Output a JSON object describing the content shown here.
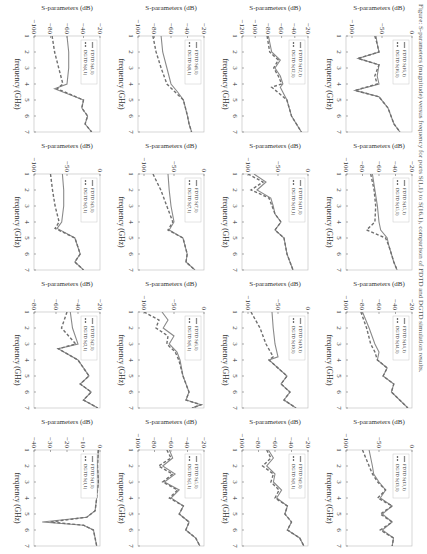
{
  "chart_data": [
    {
      "type": "line",
      "id": "S(1,1)",
      "legend": [
        "FDTD S(1,1)",
        "DGTD S(1,1)"
      ],
      "xlabel": "frequency (GHz)",
      "ylabel": "S-parameters (dB)",
      "xticks": [
        1,
        2,
        3,
        4,
        5,
        6,
        7
      ],
      "yticks": [
        0,
        -10,
        -20,
        -30,
        -40
      ],
      "ylim": [
        -40,
        0
      ],
      "x": [
        1,
        2,
        3,
        4,
        4.8,
        5.2,
        5.5,
        5.7,
        6,
        6.5,
        7
      ],
      "series": [
        {
          "name": "FDTD S(1,1)",
          "values": [
            -1,
            -1.5,
            -1,
            -2,
            -3,
            -8,
            -35,
            -10,
            -4,
            -3,
            -2
          ]
        },
        {
          "name": "DGTD S(1,1)",
          "values": [
            -1,
            -1.5,
            -1,
            -2,
            -3,
            -8,
            -30,
            -10,
            -4,
            -3,
            -2
          ]
        }
      ]
    },
    {
      "type": "line",
      "id": "S(2,1)",
      "legend": [
        "FDTD S(2,1)",
        "DGTD S(2,1)"
      ],
      "xlabel": "frequency (GHz)",
      "ylabel": "S-parameters (dB)",
      "xticks": [
        1,
        2,
        3,
        4,
        5,
        6,
        7
      ],
      "yticks": [
        -20,
        -40,
        -60,
        -80
      ],
      "ylim": [
        -80,
        -20
      ],
      "x": [
        1,
        2,
        3,
        3.3,
        4,
        5,
        5.5,
        6,
        6.5,
        7
      ],
      "series": [
        {
          "name": "FDTD S(2,1)",
          "values": [
            -47,
            -45,
            -40,
            -58,
            -40,
            -30,
            -38,
            -28,
            -35,
            -22
          ]
        },
        {
          "name": "DGTD S(2,1)",
          "values": [
            -50,
            -55,
            -42,
            -58,
            -40,
            -30,
            -38,
            -28,
            -35,
            -22
          ]
        }
      ]
    },
    {
      "type": "line",
      "id": "S(3,1)",
      "legend": [
        "FDTD S(3,1)",
        "DGTD S(3,1)"
      ],
      "xlabel": "frequency (GHz)",
      "ylabel": "S-parameters (dB)",
      "xticks": [
        1,
        2,
        3,
        4,
        5,
        6,
        7
      ],
      "yticks": [
        0,
        -50,
        -100
      ],
      "ylim": [
        -100,
        0
      ],
      "x": [
        1,
        2,
        3,
        4,
        4.4,
        5,
        6,
        6.5,
        7
      ],
      "series": [
        {
          "name": "FDTD S(3,1)",
          "values": [
            -57,
            -55,
            -55,
            -58,
            -65,
            -38,
            -30,
            -38,
            -25
          ]
        },
        {
          "name": "DGTD S(3,1)",
          "values": [
            -75,
            -72,
            -68,
            -62,
            -68,
            -38,
            -30,
            -38,
            -25
          ]
        }
      ]
    },
    {
      "type": "line",
      "id": "S(4,1)",
      "legend": [
        "FDTD S(4,1)",
        "DGTD S(4,1)"
      ],
      "xlabel": "frequency (GHz)",
      "ylabel": "S-parameters (dB)",
      "xticks": [
        1,
        2,
        3,
        4,
        5,
        6,
        7
      ],
      "yticks": [
        -20,
        -40,
        -60,
        -80,
        -100
      ],
      "ylim": [
        -100,
        -20
      ],
      "x": [
        1,
        2,
        3,
        4,
        4.3,
        5,
        5.5,
        6,
        6.5,
        7
      ],
      "series": [
        {
          "name": "FDTD S(4,1)",
          "values": [
            -60,
            -58,
            -58,
            -60,
            -75,
            -40,
            -42,
            -35,
            -38,
            -30
          ]
        },
        {
          "name": "DGTD S(4,1)",
          "values": [
            -78,
            -75,
            -70,
            -65,
            -72,
            -40,
            -42,
            -35,
            -38,
            -30
          ]
        }
      ]
    },
    {
      "type": "line",
      "id": "S(5,1)",
      "legend": [
        "FDTD S(5,1)",
        "DGTD S(5,1)"
      ],
      "xlabel": "frequency (GHz)",
      "ylabel": "S-parameters (dB)",
      "xticks": [
        1,
        2,
        3,
        4,
        5,
        6,
        7
      ],
      "yticks": [
        -20,
        -40,
        -60,
        -80,
        -100
      ],
      "ylim": [
        -100,
        -20
      ],
      "x": [
        1,
        1.5,
        2,
        2.5,
        3,
        3.5,
        4,
        4.5,
        5,
        5.5,
        6,
        6.5,
        7
      ],
      "series": [
        {
          "name": "FDTD S(5,1)",
          "values": [
            -62,
            -58,
            -70,
            -55,
            -68,
            -50,
            -60,
            -45,
            -50,
            -38,
            -42,
            -30,
            -25
          ]
        },
        {
          "name": "DGTD S(5,1)",
          "values": [
            -65,
            -60,
            -75,
            -58,
            -70,
            -52,
            -62,
            -45,
            -50,
            -38,
            -42,
            -30,
            -25
          ]
        }
      ]
    },
    {
      "type": "line",
      "id": "S(6,1)",
      "legend": [
        "FDTD S(6,1)",
        "DGTD S(6,1)"
      ],
      "xlabel": "frequency (GHz)",
      "ylabel": "S-parameters (dB)",
      "xticks": [
        1,
        2,
        3,
        4,
        5,
        6,
        7
      ],
      "yticks": [
        0,
        -50,
        -100
      ],
      "ylim": [
        -110,
        0
      ],
      "x": [
        1,
        1.5,
        2,
        2.5,
        3,
        3.5,
        4,
        5,
        6,
        6.5,
        6.8,
        7
      ],
      "series": [
        {
          "name": "FDTD S(6,1)",
          "values": [
            -70,
            -60,
            -68,
            -50,
            -58,
            -45,
            -40,
            -35,
            -25,
            -30,
            -5,
            -20
          ]
        },
        {
          "name": "DGTD S(6,1)",
          "values": [
            -100,
            -75,
            -80,
            -60,
            -62,
            -48,
            -42,
            -35,
            -25,
            -30,
            -5,
            -20
          ]
        }
      ]
    },
    {
      "type": "line",
      "id": "S(7,1)",
      "legend": [
        "FDTD S(7,1)",
        "DGTD S(7,1)"
      ],
      "xlabel": "frequency (GHz)",
      "ylabel": "S-parameters (dB)",
      "xticks": [
        1,
        2,
        3,
        4,
        5,
        6,
        7
      ],
      "yticks": [
        0,
        -50,
        -100
      ],
      "ylim": [
        -110,
        0
      ],
      "x": [
        1,
        2,
        3,
        4,
        4.5,
        5,
        6,
        6.5,
        7
      ],
      "series": [
        {
          "name": "FDTD S(7,1)",
          "values": [
            -60,
            -58,
            -55,
            -50,
            -58,
            -35,
            -28,
            -30,
            -15
          ]
        },
        {
          "name": "DGTD S(7,1)",
          "values": [
            -85,
            -72,
            -62,
            -52,
            -60,
            -35,
            -28,
            -30,
            -15
          ]
        }
      ]
    },
    {
      "type": "line",
      "id": "S(8,1)",
      "legend": [
        "FDTD S(8,1)",
        "DGTD S(8,1)"
      ],
      "xlabel": "frequency (GHz)",
      "ylabel": "S-parameters (dB)",
      "xticks": [
        1,
        2,
        3,
        4,
        5,
        6,
        7
      ],
      "yticks": [
        -20,
        -40,
        -60,
        -80,
        -100
      ],
      "ylim": [
        -100,
        -20
      ],
      "x": [
        1,
        2,
        3,
        4,
        4.5,
        5,
        6,
        6.5,
        7
      ],
      "series": [
        {
          "name": "FDTD S(8,1)",
          "values": [
            -72,
            -70,
            -65,
            -60,
            -52,
            -45,
            -40,
            -38,
            -35
          ]
        },
        {
          "name": "DGTD S(8,1)",
          "values": [
            -82,
            -78,
            -72,
            -65,
            -55,
            -45,
            -40,
            -38,
            -35
          ]
        }
      ]
    },
    {
      "type": "line",
      "id": "S(9,1)",
      "legend": [
        "FDTD S(9,1)",
        "DGTD S(9,1)"
      ],
      "xlabel": "frequency (GHz)",
      "ylabel": "S-parameters (dB)",
      "xticks": [
        1,
        2,
        3,
        4,
        5,
        6,
        7
      ],
      "yticks": [
        -20,
        -40,
        -60,
        -80,
        -100
      ],
      "ylim": [
        -100,
        -20
      ],
      "x": [
        1,
        1.5,
        2,
        2.5,
        3,
        3.5,
        4,
        4.5,
        5,
        5.5,
        6,
        6.5,
        7
      ],
      "series": [
        {
          "name": "FDTD S(9,1)",
          "values": [
            -68,
            -62,
            -70,
            -60,
            -62,
            -52,
            -58,
            -45,
            -48,
            -40,
            -45,
            -30,
            -25
          ]
        },
        {
          "name": "DGTD S(9,1)",
          "values": [
            -70,
            -65,
            -75,
            -62,
            -65,
            -55,
            -60,
            -45,
            -48,
            -40,
            -45,
            -30,
            -25
          ]
        }
      ]
    },
    {
      "type": "line",
      "id": "S(10,1)",
      "legend": [
        "FDTD S(10,1)",
        "DGTD S(10,1)"
      ],
      "xlabel": "frequency (GHz)",
      "ylabel": "S-parameters (dB)",
      "xticks": [
        1,
        2,
        3,
        4,
        5,
        6,
        7
      ],
      "yticks": [
        0,
        -50,
        -100
      ],
      "ylim": [
        -110,
        0
      ],
      "x": [
        1,
        2,
        3,
        3.8,
        4,
        5,
        5.5,
        6,
        6.5,
        7
      ],
      "series": [
        {
          "name": "FDTD S(10,1)",
          "values": [
            -60,
            -58,
            -55,
            -50,
            -65,
            -35,
            -45,
            -30,
            -40,
            -20
          ]
        },
        {
          "name": "DGTD S(10,1)",
          "values": [
            -95,
            -80,
            -70,
            -58,
            -65,
            -35,
            -45,
            -30,
            -40,
            -20
          ]
        }
      ]
    },
    {
      "type": "line",
      "id": "S(11,1)",
      "legend": [
        "FDTD S(11,1)",
        "DGTD S(11,1)"
      ],
      "xlabel": "frequency (GHz)",
      "ylabel": "S-parameters (dB)",
      "xticks": [
        1,
        2,
        3,
        4,
        5,
        6,
        7
      ],
      "yticks": [
        0,
        -50,
        -100
      ],
      "ylim": [
        -110,
        0
      ],
      "x": [
        1,
        1.5,
        2,
        2.5,
        3,
        3.5,
        4,
        4.5,
        5,
        6,
        7
      ],
      "series": [
        {
          "name": "FDTD S(11,1)",
          "values": [
            -90,
            -70,
            -85,
            -62,
            -58,
            -55,
            -45,
            -55,
            -40,
            -35,
            -25
          ]
        },
        {
          "name": "DGTD S(11,1)",
          "values": [
            -100,
            -75,
            -95,
            -65,
            -60,
            -55,
            -45,
            -55,
            -40,
            -35,
            -25
          ]
        }
      ]
    },
    {
      "type": "line",
      "id": "S(12,1)",
      "legend": [
        "FDTD S(12,1)",
        "DGTD S(12,1)"
      ],
      "xlabel": "frequency (GHz)",
      "ylabel": "S-parameters (dB)",
      "xticks": [
        1,
        2,
        3,
        4,
        5,
        6,
        7
      ],
      "yticks": [
        -20,
        -40,
        -60,
        -80,
        -100,
        -120
      ],
      "ylim": [
        -120,
        -20
      ],
      "x": [
        1,
        2,
        2.5,
        3,
        3.5,
        4,
        4.2,
        5,
        6,
        7
      ],
      "series": [
        {
          "name": "FDTD S(12,1)",
          "values": [
            -80,
            -75,
            -62,
            -70,
            -62,
            -58,
            -62,
            -52,
            -45,
            -30
          ]
        },
        {
          "name": "DGTD S(12,1)",
          "values": [
            -82,
            -78,
            -65,
            -72,
            -65,
            -60,
            -75,
            -52,
            -45,
            -30
          ]
        }
      ]
    },
    {
      "type": "line",
      "id": "S(13,1)",
      "legend": [
        "FDTD S(13,1)",
        "DGTD S(13,1)"
      ],
      "xlabel": "frequency (GHz)",
      "ylabel": "S-parameters (dB)",
      "xticks": [
        1,
        2,
        3,
        4,
        5,
        6,
        7
      ],
      "yticks": [
        0,
        -50,
        -100
      ],
      "ylim": [
        -100,
        0
      ],
      "x": [
        1,
        2,
        2.5,
        3,
        3.5,
        4,
        4.5,
        5,
        5.5,
        6,
        6.5,
        7
      ],
      "series": [
        {
          "name": "FDTD S(13,1)",
          "values": [
            -65,
            -60,
            -58,
            -50,
            -40,
            -48,
            -30,
            -45,
            -30,
            -45,
            -28,
            -30
          ]
        },
        {
          "name": "DGTD S(13,1)",
          "values": [
            -75,
            -65,
            -60,
            -52,
            -40,
            -52,
            -30,
            -48,
            -30,
            -48,
            -28,
            -30
          ]
        }
      ]
    },
    {
      "type": "line",
      "id": "S(14,1)",
      "legend": [
        "FDTD S(14,1)",
        "DGTD S(14,1)"
      ],
      "xlabel": "frequency (GHz)",
      "ylabel": "S-parameters (dB)",
      "xticks": [
        1,
        2,
        3,
        4,
        5,
        6,
        7
      ],
      "yticks": [
        -20,
        -40,
        -60,
        -80,
        -100
      ],
      "ylim": [
        -100,
        -20
      ],
      "x": [
        1,
        2,
        3,
        3.5,
        4,
        4.5,
        5,
        5.5,
        6,
        7
      ],
      "series": [
        {
          "name": "FDTD S(14,1)",
          "values": [
            -80,
            -72,
            -65,
            -60,
            -62,
            -50,
            -55,
            -42,
            -45,
            -25
          ]
        },
        {
          "name": "DGTD S(14,1)",
          "values": [
            -82,
            -75,
            -70,
            -65,
            -62,
            -50,
            -55,
            -42,
            -45,
            -25
          ]
        }
      ]
    },
    {
      "type": "line",
      "id": "S(15,1)",
      "legend": [
        "FDTD S(15,1)",
        "DGTD S(15,1)"
      ],
      "xlabel": "frequency (GHz)",
      "ylabel": "S-parameters (dB)",
      "xticks": [
        1,
        2,
        3,
        4,
        5,
        6,
        7
      ],
      "yticks": [
        -20,
        -40,
        -60,
        -80,
        -100
      ],
      "ylim": [
        -100,
        -20
      ],
      "x": [
        1,
        2,
        3,
        4,
        4.5,
        5,
        5.5,
        6,
        6.5,
        7
      ],
      "series": [
        {
          "name": "FDTD S(15,1)",
          "values": [
            -68,
            -65,
            -62,
            -60,
            -58,
            -50,
            -48,
            -45,
            -42,
            -38
          ]
        },
        {
          "name": "DGTD S(15,1)",
          "values": [
            -70,
            -66,
            -64,
            -65,
            -75,
            -52,
            -48,
            -45,
            -42,
            -38
          ]
        }
      ]
    },
    {
      "type": "line",
      "id": "S(16,1)",
      "legend": [
        "FDTD S(16,1)",
        "DGTD S(16,1)"
      ],
      "xlabel": "frequency (GHz)",
      "ylabel": "S-parameters (dB)",
      "xticks": [
        1,
        2,
        3,
        4,
        5,
        6,
        7
      ],
      "yticks": [
        0,
        -50,
        -100
      ],
      "ylim": [
        -110,
        0
      ],
      "x": [
        1,
        1.5,
        2,
        2.4,
        2.8,
        3.5,
        4,
        4.4,
        4.8,
        5.5,
        6,
        6.5,
        7
      ],
      "series": [
        {
          "name": "FDTD S(16,1)",
          "values": [
            -60,
            -58,
            -55,
            -90,
            -55,
            -58,
            -55,
            -95,
            -55,
            -40,
            -35,
            -30,
            -20
          ]
        },
        {
          "name": "DGTD S(16,1)",
          "values": [
            -62,
            -58,
            -55,
            -90,
            -55,
            -62,
            -58,
            -95,
            -55,
            -40,
            -35,
            -30,
            -20
          ]
        }
      ]
    }
  ],
  "layout": [
    [
      3,
      2,
      1,
      0
    ],
    [
      7,
      6,
      5,
      4
    ],
    [
      11,
      10,
      9,
      8
    ],
    [
      15,
      14,
      13,
      12
    ]
  ],
  "colors": {
    "fdtd": "#8a8a8a",
    "dgtd": "#6f6f6f",
    "axis": "#555555",
    "legend_border": "#c8c8c8"
  },
  "caption": "Figure: S-parameters (magnitude) versus frequency for ports S(1,1) to S(16,1), comparison of FDTD and DGTD simulation results."
}
